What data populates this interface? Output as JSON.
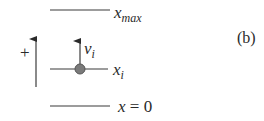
{
  "figure": {
    "panel_label": "(b)",
    "levels": {
      "top": {
        "base": "x",
        "sub": "max"
      },
      "middle": {
        "base": "x",
        "sub": "i"
      },
      "bottom": {
        "text": "x = 0",
        "var": "x",
        "eq": " = 0"
      }
    },
    "velocity": {
      "base": "v",
      "sub": "i"
    },
    "direction": {
      "sign": "+"
    },
    "colors": {
      "line": "#3a3a3a",
      "particle": "#7a7a7a",
      "particle_stroke": "#555555",
      "text": "#2a2a2a"
    }
  }
}
